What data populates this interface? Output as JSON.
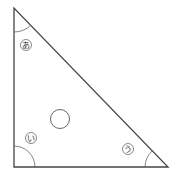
{
  "diagram": {
    "type": "right-triangle",
    "stroke_color": "#444444",
    "arc_color": "#666666",
    "angles": [
      {
        "id": "a",
        "label": "あ",
        "vertex": "top"
      },
      {
        "id": "i",
        "label": "い",
        "vertex": "bottom-left"
      },
      {
        "id": "u",
        "label": "う",
        "vertex": "bottom-right"
      }
    ],
    "center_mark": "circle"
  }
}
